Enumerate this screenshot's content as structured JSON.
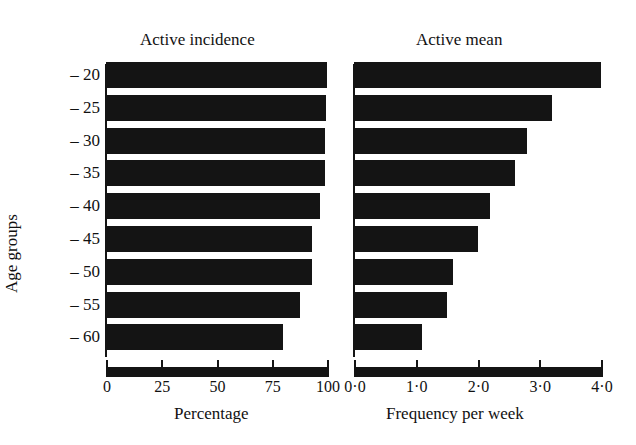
{
  "chart_data": [
    {
      "type": "bar",
      "orientation": "horizontal",
      "title": "Active incidence",
      "xlabel": "Percentage",
      "ylabel": "Age groups",
      "categories": [
        "-20",
        "-25",
        "-30",
        "-35",
        "-40",
        "-45",
        "-50",
        "-55",
        "-60"
      ],
      "values": [
        100,
        99.5,
        99,
        99,
        97,
        93,
        93,
        88,
        80
      ],
      "xlim": [
        0,
        100
      ],
      "xticks": [
        "0",
        "25",
        "50",
        "75",
        "100"
      ],
      "grid": false
    },
    {
      "type": "bar",
      "orientation": "horizontal",
      "title": "Active mean",
      "xlabel": "Frequency per week",
      "ylabel": "Age groups",
      "categories": [
        "-20",
        "-25",
        "-30",
        "-35",
        "-40",
        "-45",
        "-50",
        "-55",
        "-60"
      ],
      "values": [
        4.0,
        3.2,
        2.8,
        2.6,
        2.2,
        2.0,
        1.6,
        1.5,
        1.1
      ],
      "xlim": [
        0,
        4.0
      ],
      "xticks": [
        "0·0",
        "1·0",
        "2·0",
        "3·0",
        "4·0"
      ],
      "grid": false
    }
  ],
  "labels": {
    "left_title": "Active incidence",
    "right_title": "Active mean",
    "ylabel": "Age groups",
    "left_xlabel": "Percentage",
    "right_xlabel": "Frequency per week",
    "yticks": [
      "– 20",
      "– 25",
      "– 30",
      "– 35",
      "– 40",
      "– 45",
      "– 50",
      "– 55",
      "– 60"
    ],
    "left_xticks": [
      "0",
      "25",
      "50",
      "75",
      "100"
    ],
    "right_xticks": [
      "0·0",
      "1·0",
      "2·0",
      "3·0",
      "4·0"
    ]
  }
}
